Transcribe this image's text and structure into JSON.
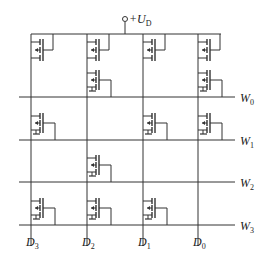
{
  "diagram": {
    "type": "MOS ROM memory array",
    "supply": {
      "label": "+U",
      "subscript": "D"
    },
    "bit_lines": [
      {
        "label": "D",
        "subscript": "3",
        "x": 31
      },
      {
        "label": "D",
        "subscript": "2",
        "x": 87
      },
      {
        "label": "D",
        "subscript": "1",
        "x": 143
      },
      {
        "label": "D",
        "subscript": "0",
        "x": 198
      }
    ],
    "word_lines": [
      {
        "label": "W",
        "subscript": "0",
        "y": 97
      },
      {
        "label": "W",
        "subscript": "1",
        "y": 140
      },
      {
        "label": "W",
        "subscript": "2",
        "y": 182
      },
      {
        "label": "W",
        "subscript": "3",
        "y": 225
      }
    ],
    "load_transistors": [
      "D3",
      "D2",
      "D1",
      "D0"
    ],
    "cell_transistors": {
      "W0": [
        "D2",
        "D0"
      ],
      "W1": [
        "D3",
        "D1",
        "D0"
      ],
      "W2": [
        "D2"
      ],
      "W3": [
        "D3",
        "D2",
        "D1"
      ]
    }
  }
}
